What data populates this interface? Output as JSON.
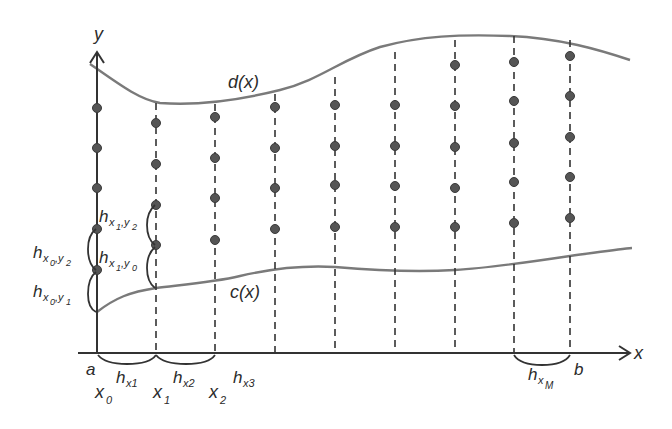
{
  "diagram": {
    "title": "",
    "colors": {
      "axis": "#333333",
      "curve": "#7a7a7a",
      "dot": "#555555",
      "dot_edge": "#3a3a3a",
      "text": "#2b2b2b"
    },
    "axes": {
      "x_label": "x",
      "y_label": "y"
    },
    "curves": {
      "upper_label": "d(x)",
      "lower_label": "c(x)"
    },
    "endpoints": {
      "left": "a",
      "right": "b"
    },
    "grid_labels": {
      "x0_main": "x",
      "x0_sub": "0",
      "x1_main": "x",
      "x1_sub": "1",
      "x2_main": "x",
      "x2_sub": "2"
    },
    "step_labels": {
      "hx1_main": "h",
      "hx1_sub": "x1",
      "hx2_main": "h",
      "hx2_sub": "x2",
      "hx3_main": "h",
      "hx3_sub": "x3",
      "hxM_main": "h",
      "hxM_sub": "x",
      "hxM_subsub": "M"
    },
    "vertical_step_labels": {
      "hx0y2_main": "h",
      "hx0y2_sub": "x",
      "hx0y2_subsub": "0",
      "hx0y2_sep": ",y",
      "hx0y2_subsub2": "2",
      "hx0y1_main": "h",
      "hx0y1_sub": "x",
      "hx0y1_subsub": "0",
      "hx0y1_sep": ",y",
      "hx0y1_subsub2": "1",
      "hx1y2_main": "h",
      "hx1y2_sub": "x",
      "hx1y2_subsub": "1",
      "hx1y2_sep": ",y",
      "hx1y2_subsub2": "2",
      "hx1y0_main": "h",
      "hx1y0_sub": "x",
      "hx1y0_subsub": "1",
      "hx1y0_sep": ",y",
      "hx1y0_subsub2": "0"
    },
    "columns": [
      {
        "x": 97,
        "dots": [
          108,
          148,
          188,
          229,
          270
        ]
      },
      {
        "x": 156,
        "dots": [
          123,
          164,
          205,
          245
        ]
      },
      {
        "x": 215,
        "dots": [
          117,
          158,
          198,
          240
        ]
      },
      {
        "x": 275,
        "dots": [
          107,
          148,
          188,
          229
        ]
      },
      {
        "x": 335,
        "dots": [
          105,
          146,
          185,
          227
        ]
      },
      {
        "x": 395,
        "dots": [
          105,
          146,
          186,
          227
        ]
      },
      {
        "x": 455,
        "dots": [
          65,
          106,
          147,
          188,
          227
        ]
      },
      {
        "x": 514,
        "dots": [
          62,
          101,
          143,
          182,
          223
        ]
      },
      {
        "x": 570,
        "dots": [
          56,
          96,
          137,
          177,
          218
        ]
      }
    ]
  }
}
